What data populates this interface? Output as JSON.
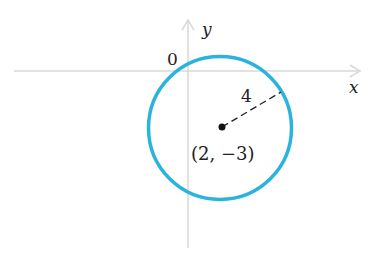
{
  "diagram": {
    "type": "circle-on-coordinate-plane",
    "axes": {
      "x_label": "x",
      "y_label": "y",
      "origin_label": "0",
      "axis_color": "#d8d8d8"
    },
    "circle": {
      "center": [
        2,
        -3
      ],
      "radius": 4,
      "center_label": "(2, −3)",
      "radius_label": "4",
      "stroke_color": "#2bb3e0"
    }
  }
}
